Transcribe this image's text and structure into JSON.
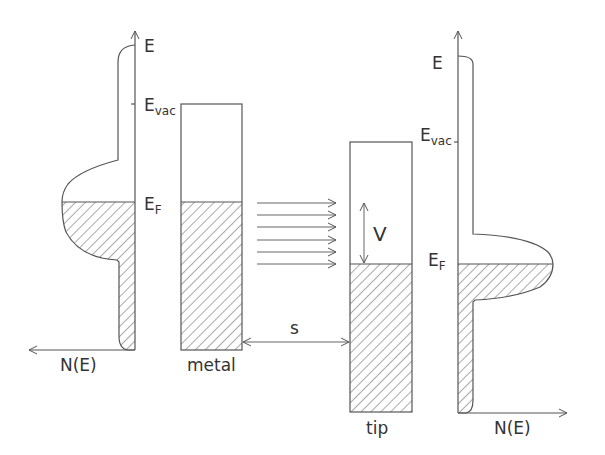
{
  "diagram": {
    "colors": {
      "line": "#555555",
      "hatch": "#555555",
      "background": "#ffffff"
    },
    "left_panel": {
      "axis_energy_label": "E",
      "vacuum_label_main": "E",
      "vacuum_label_sub": "vac",
      "fermi_label_main": "E",
      "fermi_label_sub": "F",
      "dos_axis_label": "N(E)"
    },
    "metal": {
      "label": "metal"
    },
    "gap": {
      "label": "s"
    },
    "bias": {
      "label": "V"
    },
    "tip": {
      "label": "tip"
    },
    "right_panel": {
      "axis_energy_label": "E",
      "vacuum_label_main": "E",
      "vacuum_label_sub": "vac",
      "fermi_label_main": "E",
      "fermi_label_sub": "F",
      "dos_axis_label": "N(E)"
    },
    "tunneling_arrows_count": 6
  }
}
